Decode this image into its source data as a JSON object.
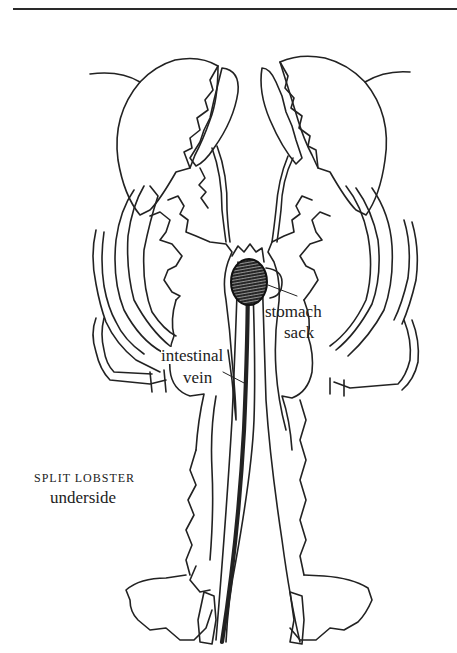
{
  "figure": {
    "colors": {
      "ink": "#222222",
      "background": "#ffffff",
      "rule": "#2a2a2a"
    }
  },
  "labels": {
    "stomach_line1": "stomach",
    "stomach_line2": "sack",
    "intestinal_line1": "intestinal",
    "intestinal_line2": "vein"
  },
  "caption": {
    "title": "SPLIT LOBSTER",
    "subtitle": "underside"
  }
}
